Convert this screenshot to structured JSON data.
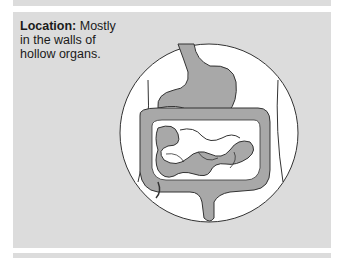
{
  "caption": {
    "label": "Location:",
    "text": " Mostly in the walls of hollow organs."
  },
  "figure": {
    "colors": {
      "panel": "#dcdcdc",
      "circle_fill": "#ffffff",
      "organ_fill": "#a8a8a8",
      "outline": "#333333"
    }
  }
}
